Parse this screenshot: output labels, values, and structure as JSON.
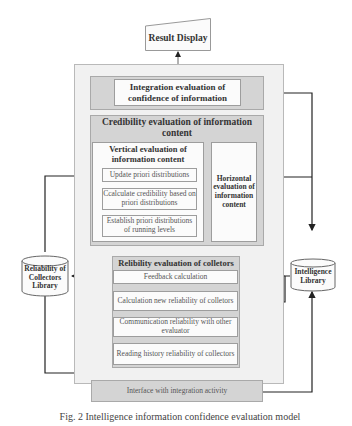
{
  "diagram": {
    "result_display": "Result Display",
    "integration": {
      "label": "Integration evaluation of confidence of information"
    },
    "credibility": {
      "title": "Credibility evaluation of information content",
      "vertical": {
        "title": "Vertical evaluation of information content",
        "steps": [
          "Update priori distributions",
          "Ccalculate credibility based on priori distributions",
          "Establish priori distributions of running levels"
        ]
      },
      "horizontal": "Horizontal evaluation of information content"
    },
    "reliability": {
      "title": "Relibility evaluation of colletors",
      "steps": [
        "Feedback calculation",
        "Calculation new reliability of colletors",
        "Communication reliability with other evaluator",
        "Reading history reliability of collectors"
      ]
    },
    "left_library": "Reliability of Collectors Library",
    "right_library": "Intelligence Library",
    "interface": "Interface with integration activity",
    "caption": "Fig. 2 Intelligence information confidence evaluation model"
  }
}
